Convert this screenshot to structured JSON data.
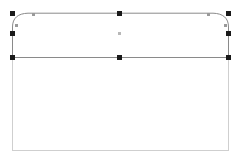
{
  "canvas": {
    "width": 242,
    "height": 167,
    "background_color": "#ffffff",
    "label": "drawing-canvas"
  },
  "colors": {
    "selected_stroke": "#8a8a8a",
    "unselected_stroke": "#cfcfcf",
    "handle_fill": "#1a1a1a",
    "node_fill": "#9a9a9a",
    "center_marker_fill": "#b8b8b8",
    "shape_fill": "#ffffff"
  },
  "shapes": [
    {
      "name": "envelope-flap-path",
      "selected": true,
      "stroke": "#8a8a8a",
      "stroke_width": 1,
      "fill": "#ffffff",
      "path": "M 12.5 57.5 L 12.5 27 C 12.5 18 18 13.5 28 13.2 L 213 13.2 C 223 13.5 228.5 18 228.5 27 L 228.5 57.5 Z"
    },
    {
      "name": "envelope-body-rect",
      "selected": false,
      "stroke": "#cfcfcf",
      "stroke_width": 1,
      "fill": "#ffffff",
      "x": 12.5,
      "y": 57.5,
      "width": 216,
      "height": 93
    },
    {
      "name": "flap-divider-line",
      "selected": true,
      "stroke": "#8a8a8a",
      "stroke_width": 1.2,
      "x1": 12.5,
      "y1": 57.5,
      "x2": 228.5,
      "y2": 57.5
    }
  ],
  "selection": {
    "active": true,
    "handle_count": 8,
    "handle_size": 5,
    "handles": [
      {
        "name": "handle-top-left",
        "x": 12,
        "y": 13
      },
      {
        "name": "handle-top-center",
        "x": 119,
        "y": 13
      },
      {
        "name": "handle-top-right",
        "x": 228,
        "y": 13
      },
      {
        "name": "handle-middle-left",
        "x": 12,
        "y": 33
      },
      {
        "name": "handle-middle-right",
        "x": 228,
        "y": 33
      },
      {
        "name": "handle-bottom-left",
        "x": 12,
        "y": 57
      },
      {
        "name": "handle-bottom-center",
        "x": 119,
        "y": 57
      },
      {
        "name": "handle-bottom-right",
        "x": 228,
        "y": 57
      }
    ],
    "control_nodes": [
      {
        "name": "control-node-top-left",
        "x": 33,
        "y": 14
      },
      {
        "name": "control-node-top-right",
        "x": 208,
        "y": 14
      },
      {
        "name": "control-node-right-upper",
        "x": 225,
        "y": 25
      },
      {
        "name": "control-node-left-upper",
        "x": 16,
        "y": 25
      }
    ],
    "center_marker": {
      "name": "center-rotation-marker",
      "x": 119,
      "y": 33
    }
  }
}
